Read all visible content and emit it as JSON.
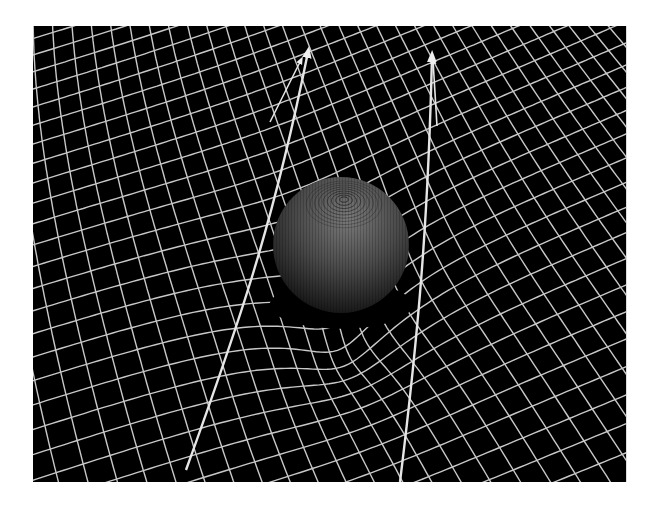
{
  "scene": {
    "description": "Spacetime curvature illustration: a sphere deforming a grid with two light-path arrows bending around it",
    "colors": {
      "background": "#ffffff",
      "panel": "#000000",
      "grid": "#c8c8c8",
      "arrow": "#e6e6e6",
      "sphere_light": "#6a6a6a",
      "sphere_dark": "#141414"
    },
    "panel": {
      "x": 33,
      "y": 26,
      "width": 593,
      "height": 456
    },
    "sphere": {
      "cx": 308,
      "cy": 219,
      "r": 68
    },
    "arrows": [
      {
        "name": "left-light-path",
        "points": [
          [
            153,
            444
          ],
          [
            205,
            300
          ],
          [
            240,
            200
          ],
          [
            275,
            26
          ]
        ]
      },
      {
        "name": "right-light-path",
        "points": [
          [
            367,
            456
          ],
          [
            385,
            310
          ],
          [
            395,
            200
          ],
          [
            399,
            30
          ]
        ]
      }
    ]
  }
}
